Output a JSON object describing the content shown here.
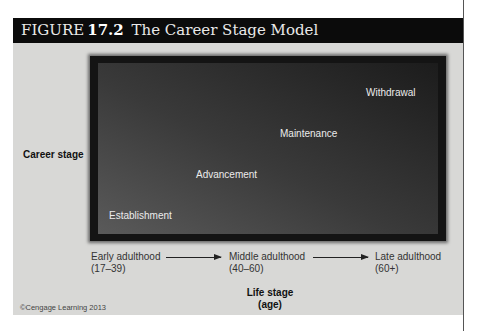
{
  "figure": {
    "label": "FIGURE",
    "number": "17.2",
    "title": "The Career Stage Model"
  },
  "diagram": {
    "y_axis_label": "Career stage",
    "x_axis_label_line1": "Life stage",
    "x_axis_label_line2": "(age)",
    "career_stages": [
      "Establishment",
      "Advancement",
      "Maintenance",
      "Withdrawal"
    ],
    "life_stages": [
      {
        "name": "Early adulthood",
        "range": "(17–39)"
      },
      {
        "name": "Middle adulthood",
        "range": "(40–60)"
      },
      {
        "name": "Late adulthood",
        "range": "(60+)"
      }
    ]
  },
  "copyright": "©Cengage Learning 2013"
}
